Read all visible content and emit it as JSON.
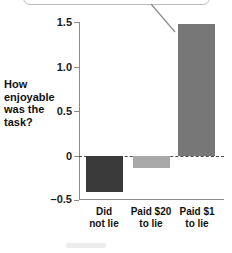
{
  "chart_data": {
    "type": "bar",
    "title": "",
    "xlabel": "",
    "ylabel": "How enjoyable was the task?",
    "categories": [
      "Did not lie",
      "Paid $20 to lie",
      "Paid $1 to lie"
    ],
    "category_lines": [
      [
        "Did",
        "not lie"
      ],
      [
        "Paid $20",
        "to lie"
      ],
      [
        "Paid $1",
        "to lie"
      ]
    ],
    "values": [
      -0.4,
      -0.13,
      1.48
    ],
    "bar_colors": [
      "#3a3a3a",
      "#a8a8a8",
      "#777777"
    ],
    "ylim": [
      -0.5,
      1.5
    ],
    "yticks": [
      1.5,
      1.0,
      0.5,
      0,
      -0.5
    ],
    "ytick_labels": [
      "1.5",
      "1.0",
      "0.5",
      "0",
      "–0.5"
    ],
    "grid": false,
    "zero_line": true,
    "zero_line_style": "dashed",
    "legend": "none",
    "annotations": [
      {
        "name": "callout",
        "text": "",
        "points_to": "Paid $1 to lie"
      }
    ]
  },
  "axis": {
    "y_label_lines": [
      "How",
      "enjoyable",
      "was the",
      "task?"
    ]
  }
}
